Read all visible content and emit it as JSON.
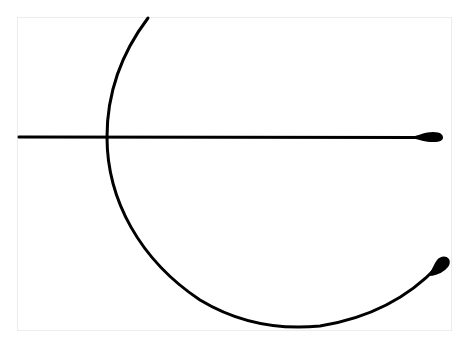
{
  "figure": {
    "stroke_color": "#000000",
    "background_color": "#ffffff",
    "frame_color": "#ececec",
    "horizontal_line": {
      "x1": 19,
      "y": 137,
      "x2": 442
    },
    "arc": {
      "start": [
        148,
        18
      ],
      "leftmost": [
        107,
        137
      ],
      "bottom": [
        295,
        327
      ],
      "end": [
        443,
        262
      ]
    }
  }
}
